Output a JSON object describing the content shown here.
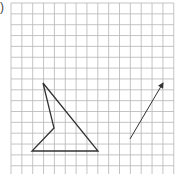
{
  "figure": {
    "label": ")",
    "grid": {
      "cols": 15,
      "rows": 16,
      "origin_x": 11,
      "origin_y": 3,
      "cell": 10.85,
      "line_color": "#b5b5b5"
    },
    "shape": {
      "name": "quadrilateral-arrowhead",
      "points": [
        [
          43,
          83
        ],
        [
          98,
          151
        ],
        [
          32,
          151
        ],
        [
          54,
          128
        ]
      ],
      "stroke": "#333333"
    },
    "vector": {
      "from": [
        130,
        139
      ],
      "to": [
        163,
        83
      ],
      "stroke": "#333333"
    }
  }
}
